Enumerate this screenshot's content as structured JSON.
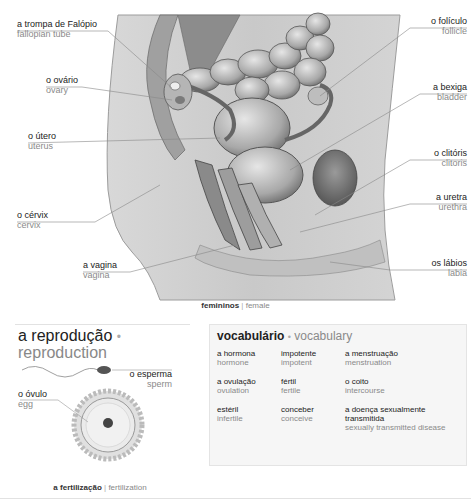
{
  "diagram": {
    "labels": [
      {
        "id": "fallopian-tube",
        "pt": "a trompa de Falópio",
        "en": "fallopian tube",
        "side": "left",
        "x": 17,
        "y": 19
      },
      {
        "id": "ovary",
        "pt": "o ovário",
        "en": "ovary",
        "side": "left",
        "x": 46,
        "y": 75
      },
      {
        "id": "uterus",
        "pt": "o útero",
        "en": "uterus",
        "side": "left",
        "x": 28,
        "y": 131
      },
      {
        "id": "cervix",
        "pt": "o cérvix",
        "en": "cervix",
        "side": "left",
        "x": 17,
        "y": 210
      },
      {
        "id": "vagina",
        "pt": "a vagina",
        "en": "vagina",
        "side": "left",
        "x": 83,
        "y": 260
      },
      {
        "id": "follicle",
        "pt": "o folículo",
        "en": "follicle",
        "side": "right",
        "x": 467,
        "y": 16
      },
      {
        "id": "bladder",
        "pt": "a bexiga",
        "en": "bladder",
        "side": "right",
        "x": 467,
        "y": 82
      },
      {
        "id": "clitoris",
        "pt": "o clitóris",
        "en": "clitoris",
        "side": "right",
        "x": 467,
        "y": 148
      },
      {
        "id": "urethra",
        "pt": "a uretra",
        "en": "urethra",
        "side": "right",
        "x": 467,
        "y": 192
      },
      {
        "id": "labia",
        "pt": "os lábios",
        "en": "labia",
        "side": "right",
        "x": 467,
        "y": 258
      }
    ],
    "caption": {
      "pt": "femininos",
      "sep": "|",
      "en": "female"
    }
  },
  "reproduction": {
    "title_pt": "a reprodução",
    "title_dot": "•",
    "title_en": "reproduction",
    "sperm": {
      "pt": "o esperma",
      "en": "sperm"
    },
    "egg": {
      "pt": "o óvulo",
      "en": "egg"
    },
    "caption": {
      "pt": "a fertilização",
      "sep": "|",
      "en": "fertilization"
    }
  },
  "vocabulary": {
    "title_pt": "vocabulário",
    "title_dot": "•",
    "title_en": "vocabulary",
    "items": [
      {
        "pt": "a hormona",
        "en": "hormone"
      },
      {
        "pt": "impotente",
        "en": "impotent"
      },
      {
        "pt": "a menstruação",
        "en": "menstruation"
      },
      {
        "pt": "a ovulação",
        "en": "ovulation"
      },
      {
        "pt": "fértil",
        "en": "fertile"
      },
      {
        "pt": "o coito",
        "en": "intercourse"
      },
      {
        "pt": "estéril",
        "en": "infertile"
      },
      {
        "pt": "conceber",
        "en": "conceive"
      },
      {
        "pt": "a doença sexualmente transmitida",
        "en": "sexually transmitted disease"
      }
    ]
  },
  "colors": {
    "text_primary": "#222222",
    "text_secondary": "#8a8a8a",
    "vocab_bg": "#f6f6f6",
    "illustration_gray": "#b8b8b8"
  }
}
